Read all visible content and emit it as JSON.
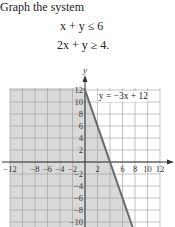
{
  "problem": {
    "prompt": "Graph the system",
    "inequalities": [
      "x + y ≤ 6",
      "2x + y ≥ 4."
    ]
  },
  "chart_data": {
    "type": "line",
    "title": "",
    "xlabel": "x",
    "ylabel": "y",
    "xlim": [
      -12,
      12
    ],
    "ylim": [
      -10,
      12
    ],
    "grid": true,
    "x_ticks": [
      -12,
      -8,
      -6,
      -4,
      -2,
      2,
      6,
      8,
      10,
      12
    ],
    "y_ticks": [
      12,
      10,
      8,
      6,
      4,
      2,
      -2,
      -4,
      -6,
      -8,
      -10
    ],
    "series": [
      {
        "name": "y = −3x + 12",
        "equation": "y = -3x + 12",
        "points": [
          [
            0,
            12
          ],
          [
            4,
            0
          ],
          [
            7.33,
            -10
          ]
        ],
        "style": "solid",
        "color": "#6b6b6b"
      }
    ],
    "shaded_region": {
      "description": "region left of line y = -3x + 12",
      "color": "#d9d9d9"
    },
    "annotations": [
      {
        "text": "y = −3x + 12",
        "x": 2.2,
        "y": 10.5
      }
    ]
  },
  "colors": {
    "grid": "#9a9a9a",
    "shade": "#d9d9d9",
    "axis": "#333333",
    "line": "#6b6b6b"
  }
}
